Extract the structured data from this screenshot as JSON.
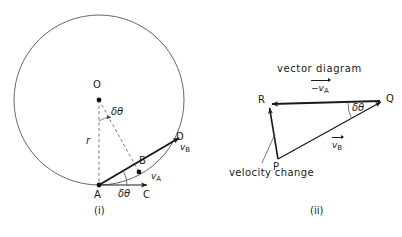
{
  "figure": {
    "background": "#ffffff",
    "ink": "#1a1a1a",
    "thin_stroke": "#555555"
  },
  "panel_i": {
    "caption": "(i)",
    "circle": {
      "cx": 99,
      "cy": 100,
      "r": 85
    },
    "points": [
      {
        "id": "O",
        "label": "O",
        "x": 99,
        "y": 100,
        "label_x": 93,
        "label_y": 80,
        "dot": true
      },
      {
        "id": "A",
        "label": "A",
        "x": 99,
        "y": 185,
        "label_x": 94,
        "label_y": 190,
        "dot": true
      },
      {
        "id": "B",
        "label": "B",
        "x": 139,
        "y": 172,
        "label_x": 139,
        "label_y": 158,
        "dot": true
      },
      {
        "id": "C",
        "label": "C",
        "x": 145,
        "y": 185,
        "label_x": 143,
        "label_y": 190,
        "dot": false
      },
      {
        "id": "D",
        "label": "D",
        "x": 178,
        "y": 137,
        "label_x": 176,
        "label_y": 134,
        "dot": false
      }
    ],
    "radius_label": "r",
    "radius_label_x": 86,
    "radius_label_y": 139,
    "angle_at_O": "δθ",
    "angle_at_O_x": 110,
    "angle_at_O_y": 112,
    "angle_at_A": "δθ",
    "angle_at_A_x": 119,
    "angle_at_A_y": 190,
    "velocity_A": {
      "name": "v",
      "sub": "A",
      "x": 152,
      "y": 176
    },
    "velocity_B": {
      "name": "v",
      "sub": "B",
      "x": 181,
      "y": 147
    }
  },
  "panel_ii": {
    "caption": "(ii)",
    "title": "vector  diagram",
    "title_x": 277,
    "title_y": 64,
    "annotation": "velocity change",
    "annotation_x": 230,
    "annotation_y": 168,
    "vertices": [
      {
        "id": "R",
        "label": "R",
        "x": 269,
        "y": 104,
        "label_x": 258,
        "label_y": 96
      },
      {
        "id": "Q",
        "label": "Q",
        "x": 383,
        "y": 101,
        "label_x": 386,
        "label_y": 95
      },
      {
        "id": "P",
        "label": "P",
        "x": 278,
        "y": 159,
        "label_x": 274,
        "label_y": 162
      }
    ],
    "label_minus_vA": {
      "prefix": "−",
      "name": "v",
      "sub": "A",
      "x": 315,
      "y": 84
    },
    "label_vB": {
      "prefix": "",
      "name": "v",
      "sub": "B",
      "x": 334,
      "y": 141
    },
    "angle_at_Q": "δθ",
    "angle_at_Q_x": 351,
    "angle_at_Q_y": 104
  }
}
